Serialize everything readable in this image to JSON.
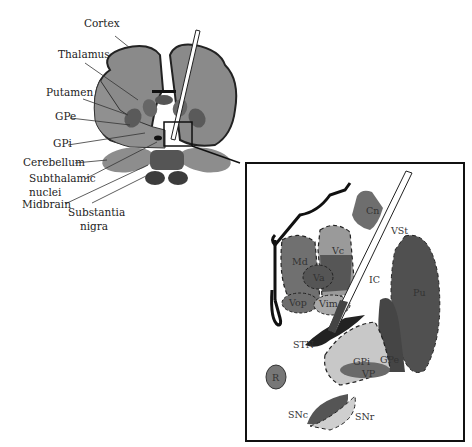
{
  "overview": {
    "labels": {
      "cortex": "Cortex",
      "thalamus": "Thalamus",
      "putamen": "Putamen",
      "gpe": "GPe",
      "gpi": "GPi",
      "cerebellum": "Cerebellum",
      "subthalamic_1": "Subthalamic",
      "subthalamic_2": "nuclei",
      "midbrain": "Midbrain",
      "substantia_1": "Substantia",
      "substantia_2": "nigra"
    }
  },
  "inset": {
    "labels": {
      "cn": "Cn",
      "vst": "VSt",
      "md": "Md",
      "vc": "Vc",
      "va": "Va",
      "ic": "IC",
      "pu": "Pu",
      "vop": "Vop",
      "vim": "Vim",
      "stn": "STN",
      "gpi": "GPi",
      "gpe": "GPe",
      "vp": "VP",
      "r": "R",
      "snc": "SNc",
      "snr": "SNr"
    }
  },
  "colors": {
    "brain_gray": "#8a8a8a",
    "dark_gray": "#555555",
    "light_gray": "#c8c8c8",
    "outline": "#111111"
  }
}
